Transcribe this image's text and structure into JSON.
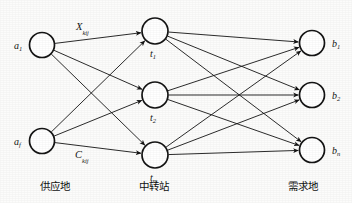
{
  "diagram": {
    "type": "transportation-network",
    "background_color": "#fcfcfb",
    "ink_color": "#141414",
    "columns": [
      {
        "id": "supply",
        "caption": "供应地",
        "caption_x": 40,
        "caption_y": 181,
        "nodes": [
          {
            "id": "a1",
            "label": "a",
            "sub": "1",
            "cx": 42,
            "cy": 45,
            "r": 12.5,
            "label_x": 14,
            "label_y": 41
          },
          {
            "id": "af",
            "label": "a",
            "sub": "f",
            "cx": 42,
            "cy": 141,
            "r": 12.5,
            "label_x": 14,
            "label_y": 137
          }
        ]
      },
      {
        "id": "transit",
        "caption": "中转站",
        "caption_x": 139,
        "caption_y": 181,
        "nodes": [
          {
            "id": "t1",
            "label": "t",
            "sub": "1",
            "cx": 155,
            "cy": 31,
            "r": 13,
            "label_x": 150,
            "label_y": 49
          },
          {
            "id": "t2",
            "label": "t",
            "sub": "2",
            "cx": 155,
            "cy": 95,
            "r": 13,
            "label_x": 150,
            "label_y": 113
          },
          {
            "id": "tm",
            "label": "t",
            "sub": "m",
            "cx": 155,
            "cy": 155,
            "r": 13,
            "label_x": 150,
            "label_y": 173
          }
        ]
      },
      {
        "id": "demand",
        "caption": "需求地",
        "caption_x": 288,
        "caption_y": 181,
        "nodes": [
          {
            "id": "b1",
            "label": "b",
            "sub": "1",
            "cx": 312,
            "cy": 43,
            "r": 12.5,
            "label_x": 332,
            "label_y": 39
          },
          {
            "id": "b2",
            "label": "b",
            "sub": "2",
            "cx": 312,
            "cy": 95,
            "r": 12.5,
            "label_x": 332,
            "label_y": 91
          },
          {
            "id": "bn",
            "label": "b",
            "sub": "n",
            "cx": 312,
            "cy": 150,
            "r": 12.5,
            "label_x": 332,
            "label_y": 146
          }
        ]
      }
    ],
    "edge_labels": [
      {
        "id": "x-kij",
        "label": "X",
        "sub": "kij",
        "x": 76,
        "y": 22
      },
      {
        "id": "c-kij",
        "label": "C",
        "sub": "kij",
        "x": 75,
        "y": 150
      }
    ],
    "edges": [
      {
        "from": "a1",
        "to": "t1"
      },
      {
        "from": "a1",
        "to": "t2"
      },
      {
        "from": "a1",
        "to": "tm"
      },
      {
        "from": "af",
        "to": "t1"
      },
      {
        "from": "af",
        "to": "t2"
      },
      {
        "from": "af",
        "to": "tm"
      },
      {
        "from": "t1",
        "to": "b1"
      },
      {
        "from": "t1",
        "to": "b2"
      },
      {
        "from": "t1",
        "to": "bn"
      },
      {
        "from": "t2",
        "to": "b1"
      },
      {
        "from": "t2",
        "to": "b2"
      },
      {
        "from": "t2",
        "to": "bn"
      },
      {
        "from": "tm",
        "to": "b1"
      },
      {
        "from": "tm",
        "to": "b2"
      },
      {
        "from": "tm",
        "to": "bn"
      }
    ]
  }
}
